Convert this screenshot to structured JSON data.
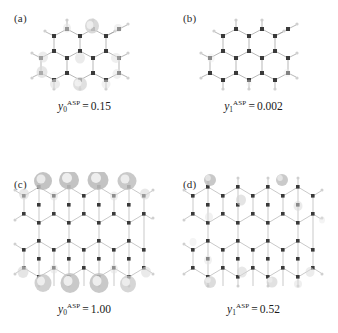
{
  "figure": {
    "background_color": "#ffffff",
    "atom_color": "#3a3a3a",
    "hydrogen_color": "#c9c9c9",
    "bond_color": "#9a9a9a",
    "lobe_color": "#d8d8d8"
  },
  "panels": [
    {
      "label": "(a)",
      "symbol": "y",
      "subscript": "0",
      "superscript": "ASP",
      "equals": "=",
      "value": "0.15",
      "structure": "small-nanographene",
      "lobe_intensity": "faint"
    },
    {
      "label": "(b)",
      "symbol": "y",
      "subscript": "1",
      "superscript": "ASP",
      "equals": "=",
      "value": "0.002",
      "structure": "small-nanographene",
      "lobe_intensity": "very-faint"
    },
    {
      "label": "(c)",
      "symbol": "y",
      "subscript": "0",
      "superscript": "ASP",
      "equals": "=",
      "value": "1.00",
      "structure": "large-nanographene",
      "lobe_intensity": "strong-edge"
    },
    {
      "label": "(d)",
      "symbol": "y",
      "subscript": "1",
      "superscript": "ASP",
      "equals": "=",
      "value": "0.52",
      "structure": "large-nanographene",
      "lobe_intensity": "faint-edge"
    }
  ]
}
